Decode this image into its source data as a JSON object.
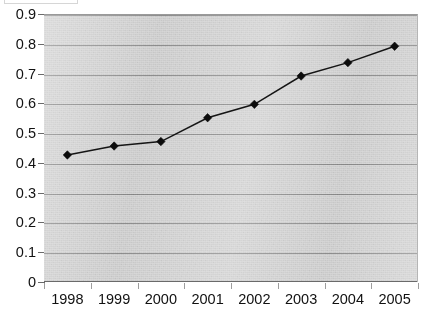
{
  "chart_data": {
    "type": "line",
    "title": "",
    "subtitle": "",
    "xlabel": "",
    "ylabel": "",
    "categories": [
      "1998",
      "1999",
      "2000",
      "2001",
      "2002",
      "2003",
      "2004",
      "2005"
    ],
    "values": [
      0.43,
      0.46,
      0.475,
      0.555,
      0.6,
      0.695,
      0.74,
      0.795
    ],
    "series": [
      {
        "name": "",
        "values": [
          0.43,
          0.46,
          0.475,
          0.555,
          0.6,
          0.695,
          0.74,
          0.795
        ]
      }
    ],
    "ylim": [
      0,
      0.9
    ],
    "ytick_labels": [
      "0.9",
      "0.8",
      "0.7",
      "0.6",
      "0.5",
      "0.4",
      "0.3",
      "0.2",
      "0.1",
      "0"
    ],
    "ytick_values": [
      0.9,
      0.8,
      0.7,
      0.6,
      0.5,
      0.4,
      0.3,
      0.2,
      0.1,
      0
    ],
    "ytick_step": 0.1,
    "xtick_labels": [
      "1998",
      "1999",
      "2000",
      "2001",
      "2002",
      "2003",
      "2004",
      "2005"
    ],
    "grid": true,
    "grid_orientation": "horizontal",
    "legend": false,
    "legend_position": "none",
    "marker": "diamond",
    "annotations": []
  },
  "style": {
    "plot_background": "#d6d6d6",
    "grid_color": "#8e8e8e",
    "axis_color": "#6a6a6a",
    "series_color": "#151515",
    "marker_color": "#0c0c0c",
    "text_color": "#111111",
    "page_background": "#ffffff"
  }
}
